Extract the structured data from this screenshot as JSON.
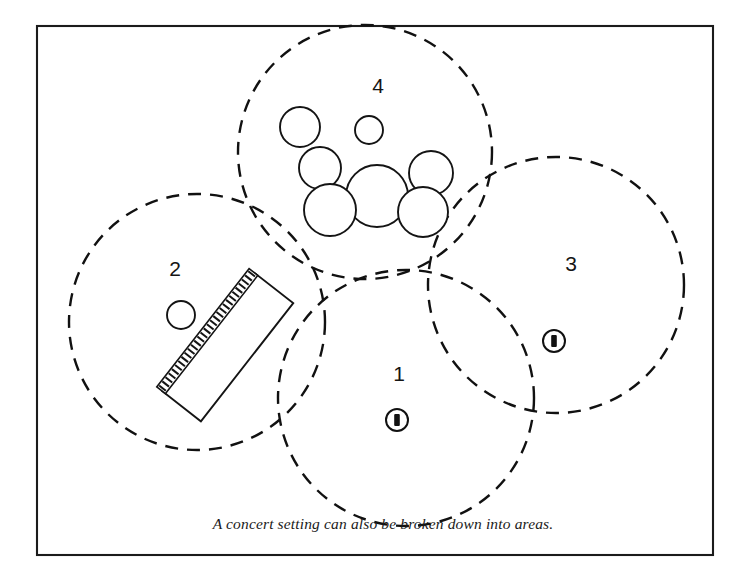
{
  "figure": {
    "caption": "A concert setting can also be broken down into areas.",
    "background_color": "#ffffff",
    "ink_color": "#111111",
    "frame": {
      "x": 37,
      "y": 26,
      "width": 676,
      "height": 529
    }
  },
  "areas": [
    {
      "id": "area-1",
      "label": "1",
      "label_x": 399,
      "label_y": 375,
      "circle": {
        "cx": 406,
        "cy": 398,
        "r": 128
      },
      "contents": [
        "microphone-marker"
      ]
    },
    {
      "id": "area-2",
      "label": "2",
      "label_x": 175,
      "label_y": 270,
      "circle": {
        "cx": 197,
        "cy": 322,
        "r": 128
      },
      "contents": [
        "keyboard",
        "monitor-circle"
      ]
    },
    {
      "id": "area-3",
      "label": "3",
      "label_x": 571,
      "label_y": 265,
      "circle": {
        "cx": 556,
        "cy": 285,
        "r": 128
      },
      "contents": [
        "microphone-marker"
      ]
    },
    {
      "id": "area-4",
      "label": "4",
      "label_x": 378,
      "label_y": 87,
      "circle": {
        "cx": 365,
        "cy": 152,
        "r": 127
      },
      "contents": [
        "drum-kit"
      ]
    }
  ],
  "props": {
    "drum_kit": {
      "name": "drum-kit",
      "pieces": [
        {
          "name": "cymbal-left-upper",
          "cx": 300,
          "cy": 127,
          "r": 20
        },
        {
          "name": "cymbal-center-small",
          "cx": 369,
          "cy": 130,
          "r": 14
        },
        {
          "name": "tom-left-upper",
          "cx": 320,
          "cy": 168,
          "r": 21
        },
        {
          "name": "tom-right-upper",
          "cx": 431,
          "cy": 173,
          "r": 22
        },
        {
          "name": "bass-drum-center",
          "cx": 377,
          "cy": 196,
          "r": 31
        },
        {
          "name": "floor-tom-left",
          "cx": 330,
          "cy": 210,
          "r": 26
        },
        {
          "name": "floor-tom-right",
          "cx": 423,
          "cy": 212,
          "r": 25
        }
      ]
    },
    "keyboard": {
      "name": "keyboard",
      "center_x": 225,
      "center_y": 345,
      "body_width": 57,
      "body_length": 150,
      "rotation_deg": -52,
      "key_count": 29
    },
    "monitor_circle": {
      "name": "monitor-circle",
      "cx": 181,
      "cy": 315,
      "r": 14
    },
    "microphone_markers": [
      {
        "name": "microphone-marker-area-1",
        "cx": 397,
        "cy": 420,
        "ring_r": 11
      },
      {
        "name": "microphone-marker-area-3",
        "cx": 554,
        "cy": 341,
        "ring_r": 11
      }
    ]
  }
}
